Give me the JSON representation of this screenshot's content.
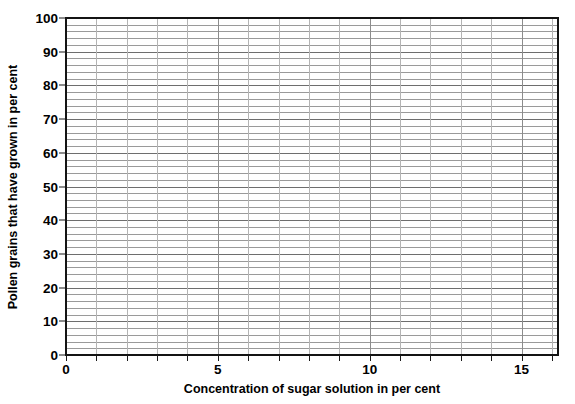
{
  "chart_data": {
    "type": "line",
    "title": "",
    "subtitle": "",
    "xlabel": "Concentration of sugar solution in per cent",
    "ylabel": "Pollen grains that have grown in per cent",
    "xlim": [
      0,
      16.2
    ],
    "ylim": [
      0,
      100
    ],
    "x_major_ticks": [
      0,
      5,
      10,
      15
    ],
    "x_major_tick_labels": [
      "0",
      "5",
      "10",
      "15"
    ],
    "x_minor_tick_step": 1,
    "y_major_ticks": [
      0,
      10,
      20,
      30,
      40,
      50,
      60,
      70,
      80,
      90,
      100
    ],
    "y_major_tick_labels": [
      "0",
      "10",
      "20",
      "30",
      "40",
      "50",
      "60",
      "70",
      "80",
      "90",
      "100"
    ],
    "y_minor_gridline_step": 2,
    "x_gridline_step": 1,
    "grid": true,
    "grid_axes": "both",
    "legend": false,
    "legend_position": "none",
    "series": [],
    "values": [],
    "categories": [],
    "annotations": [],
    "note": "Blank plotting grid — no data series are drawn on the axes.",
    "colors": {
      "background": "#ffffff",
      "axis": "#141414",
      "gridline_horizontal": "#9a9a9a",
      "gridline_horizontal_major": "#6e6e6e",
      "gridline_vertical": "#b4b4b4",
      "gridline_vertical_major": "#8c8c8c",
      "text": "#000000"
    }
  }
}
